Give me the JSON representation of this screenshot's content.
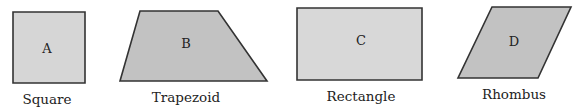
{
  "shapes": [
    {
      "id": "A",
      "letter": "A",
      "name": "Square",
      "fill": "#d6d6d6",
      "points": "13,12 85,12 85,83 13,83",
      "letter_pos": [
        47,
        53
      ],
      "name_pos": [
        47,
        104
      ]
    },
    {
      "id": "B",
      "letter": "B",
      "name": "Trapezoid",
      "fill": "#c2c2c2",
      "points": "140,11 218,11 267,81 120,81",
      "letter_pos": [
        186,
        48
      ],
      "name_pos": [
        186,
        102
      ]
    },
    {
      "id": "C",
      "letter": "C",
      "name": "Rectangle",
      "fill": "#d8d8d8",
      "points": "297,8 422,8 422,80 297,80",
      "letter_pos": [
        361,
        45
      ],
      "name_pos": [
        361,
        101
      ]
    },
    {
      "id": "D",
      "letter": "D",
      "name": "Rhombus",
      "fill": "#c2c2c2",
      "points": "492,7 571,7 538,78 458,78",
      "letter_pos": [
        514,
        46
      ],
      "name_pos": [
        514,
        99
      ]
    }
  ],
  "stroke_color": "#333333"
}
